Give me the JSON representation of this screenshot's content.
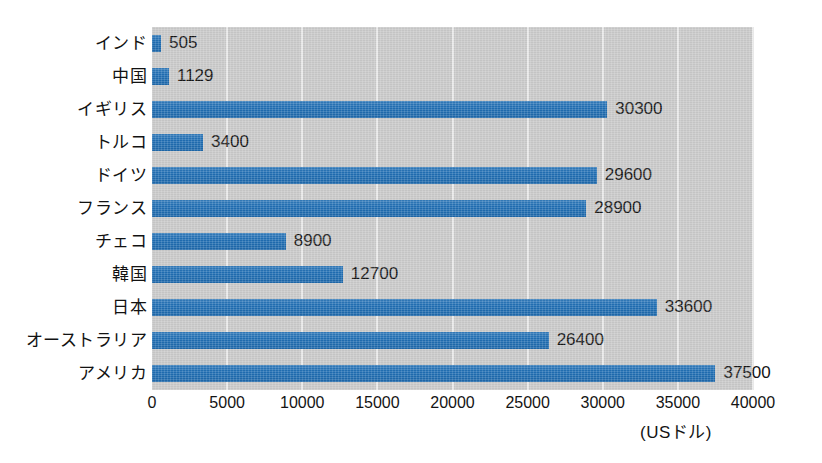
{
  "chart_data": {
    "type": "bar",
    "orientation": "horizontal",
    "title": "",
    "xlabel": "(USドル)",
    "ylabel": "",
    "categories": [
      "インド",
      "中国",
      "イギリス",
      "トルコ",
      "ドイツ",
      "フランス",
      "チェコ",
      "韓国",
      "日本",
      "オーストラリア",
      "アメリカ"
    ],
    "values": [
      505,
      1129,
      30300,
      3400,
      29600,
      28900,
      8900,
      12700,
      33600,
      26400,
      37500
    ],
    "value_labels": [
      "505",
      "1129",
      "30300",
      "3400",
      "29600",
      "28900",
      "8900",
      "12700",
      "33600",
      "26400",
      "37500"
    ],
    "xlim": [
      0,
      40000
    ],
    "xticks": [
      0,
      5000,
      10000,
      15000,
      20000,
      25000,
      30000,
      35000,
      40000
    ],
    "xtick_labels": [
      "0",
      "5000",
      "10000",
      "15000",
      "20000",
      "25000",
      "30000",
      "35000",
      "40000"
    ],
    "grid": true,
    "grid_axis": "x",
    "legend": false,
    "bar_color": "#1f6eb4",
    "plot_background": "#c9c9c9",
    "gridline_color": "#e9e9e9",
    "page_background": "#ffffff",
    "text_color": "#141414"
  }
}
